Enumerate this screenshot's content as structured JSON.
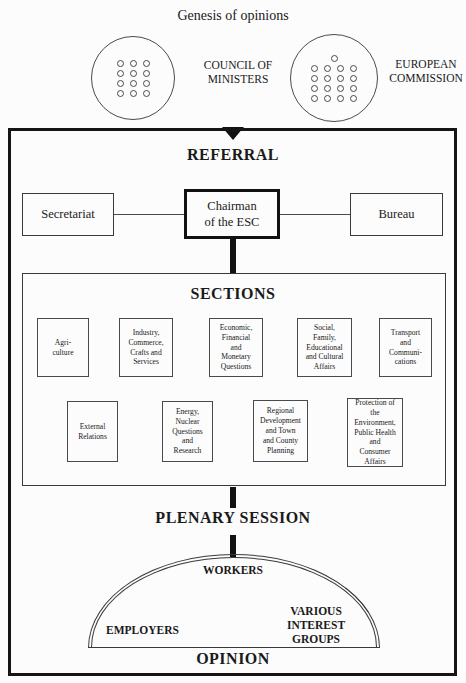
{
  "title": "Genesis of opinions",
  "institutions": {
    "council": {
      "label": "COUNCIL OF\nMINISTERS",
      "dot_rows": [
        3,
        3,
        3,
        3
      ]
    },
    "commission": {
      "label": "EUROPEAN\nCOMMISSION",
      "dot_rows": [
        1,
        4,
        4,
        4,
        4
      ]
    }
  },
  "referral": {
    "heading": "REFERRAL"
  },
  "boxes": {
    "secretariat": "Secretariat",
    "chairman": "Chairman\nof the ESC",
    "bureau": "Bureau"
  },
  "sections": {
    "heading": "SECTIONS",
    "row1": [
      {
        "label": "Agri-\nculture"
      },
      {
        "label": "Industry,\nCommerce,\nCrafts and\nServices"
      },
      {
        "label": "Economic,\nFinancial\nand\nMonetary\nQuestions"
      },
      {
        "label": "Social,\nFamily,\nEducational\nand Cultural\nAffairs"
      },
      {
        "label": "Transport\nand\nCommuni-\ncations"
      }
    ],
    "row2": [
      {
        "label": "External\nRelations"
      },
      {
        "label": "Energy,\nNuclear\nQuestions\nand\nResearch"
      },
      {
        "label": "Regional\nDevelopment\nand Town\nand County\nPlanning"
      },
      {
        "label": "Protection of\nthe\nEnvironment,\nPublic Health\nand\nConsumer\nAffairs"
      }
    ]
  },
  "plenary": {
    "heading": "PLENARY SESSION"
  },
  "groups": {
    "workers": "WORKERS",
    "employers": "EMPLOYERS",
    "various": "VARIOUS\nINTEREST\nGROUPS"
  },
  "opinion": {
    "heading": "OPINION"
  },
  "colors": {
    "ink": "#1a1a1a",
    "border": "#3a3a3a",
    "background": "#fcfcfc"
  }
}
